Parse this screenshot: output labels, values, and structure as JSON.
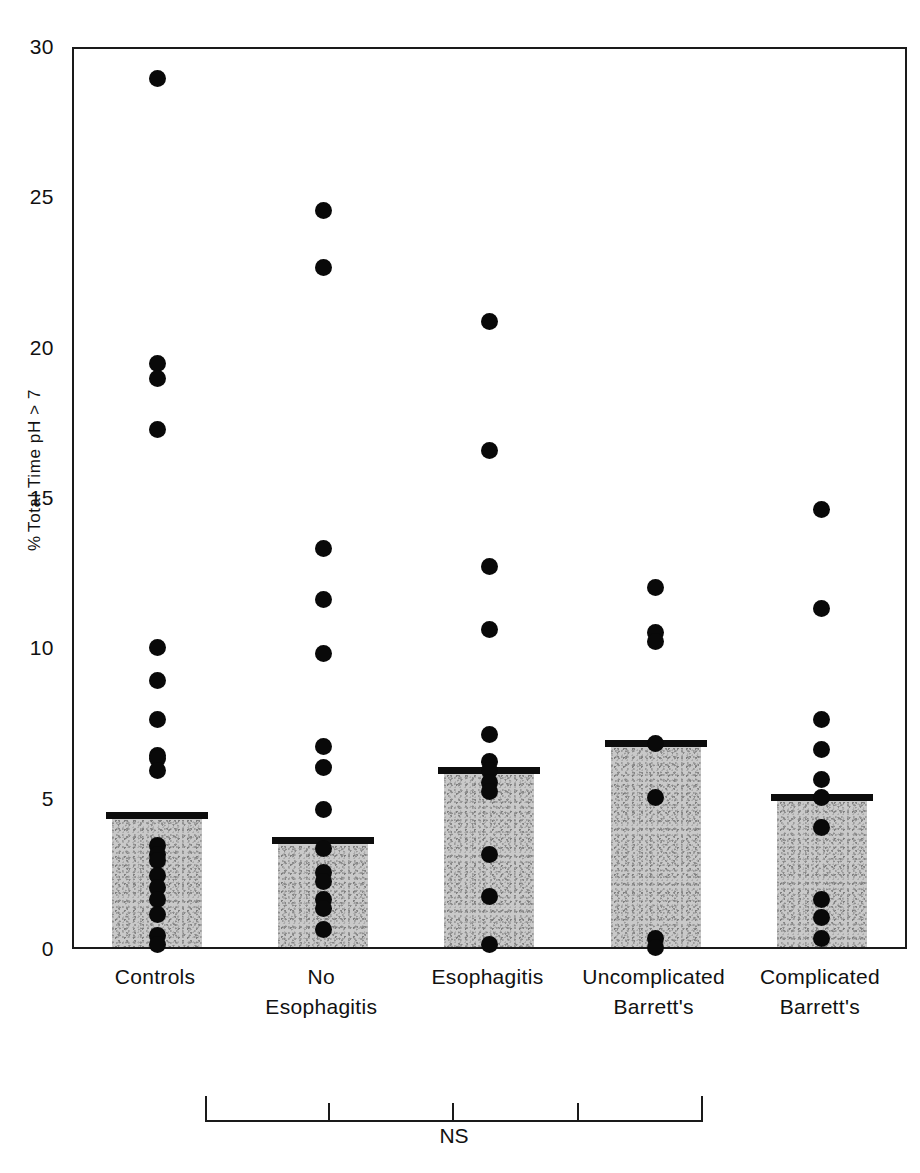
{
  "chart_data": {
    "type": "bar",
    "title": "",
    "subtitle": "",
    "xlabel": "",
    "ylabel": "% Total Time pH > 7",
    "ylim": [
      0,
      30
    ],
    "y_ticks": [
      0,
      5,
      10,
      15,
      20,
      25,
      30
    ],
    "grid": false,
    "legend": null,
    "categories": [
      "Controls",
      "No Esophagitis",
      "Esophagitis",
      "Uncomplicated Barrett's",
      "Complicated Barrett's"
    ],
    "category_lines": [
      [
        "Controls"
      ],
      [
        "No",
        "Esophagitis"
      ],
      [
        "Esophagitis"
      ],
      [
        "Uncomplicated",
        "Barrett's"
      ],
      [
        "Complicated",
        "Barrett's"
      ]
    ],
    "values": [
      4.4,
      3.55,
      5.9,
      6.8,
      5.0
    ],
    "value_note": "bar heights are group means, marked by a thick horizontal cap line",
    "series": [
      {
        "name": "Mean % total time pH > 7",
        "values": [
          4.4,
          3.55,
          5.9,
          6.8,
          5.0
        ]
      }
    ],
    "scatter_overlay": {
      "marker": "filled-circle",
      "color": "#090909",
      "points_by_category": {
        "Controls": [
          29.0,
          19.5,
          19.0,
          17.3,
          10.0,
          8.9,
          7.6,
          6.4,
          6.3,
          5.9,
          3.4,
          3.1,
          2.9,
          2.4,
          2.0,
          1.6,
          1.1,
          0.4,
          0.1
        ],
        "No Esophagitis": [
          24.6,
          22.7,
          13.3,
          11.6,
          9.8,
          6.7,
          6.0,
          4.6,
          3.3,
          2.5,
          2.2,
          1.6,
          1.3,
          0.6
        ],
        "Esophagitis": [
          20.9,
          16.6,
          12.7,
          10.6,
          7.1,
          6.2,
          5.9,
          5.5,
          5.2,
          3.1,
          1.7,
          0.1
        ],
        "Uncomplicated Barrett's": [
          12.0,
          10.5,
          10.2,
          6.8,
          5.0,
          0.3,
          0.0
        ],
        "Complicated Barrett's": [
          14.6,
          11.3,
          7.6,
          6.6,
          5.6,
          5.0,
          4.0,
          1.6,
          1.0,
          0.3
        ]
      }
    },
    "annotations": [
      {
        "text": "NS",
        "type": "significance-bracket",
        "spans": [
          "Controls",
          "Complicated Barrett's"
        ],
        "meaning": "not significant across all five groups"
      }
    ]
  },
  "axis": {
    "y_title_prefix": "%",
    "y_title_rest": " Total Time pH > 7",
    "tick_labels": [
      "0",
      "5",
      "10",
      "15",
      "20",
      "25",
      "30"
    ]
  },
  "significance": {
    "label": "NS"
  },
  "colors": {
    "bar_fill": "#c9c9c9",
    "bar_speckle": "#8e8e8e",
    "marker": "#090909",
    "axis": "#1a1a1a",
    "background": "#ffffff"
  }
}
